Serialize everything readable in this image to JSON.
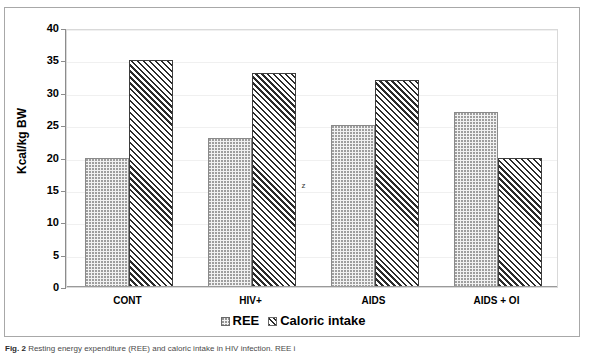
{
  "figure": {
    "caption_label": "Fig. 2",
    "caption_text": "Resting energy expenditure (REE) and caloric intake in HIV infection. REE i"
  },
  "chart_data": {
    "type": "bar",
    "title": "",
    "xlabel": "",
    "ylabel": "Kcal/kg BW",
    "categories": [
      "CONT",
      "HIV+",
      "AIDS",
      "AIDS + OI"
    ],
    "series": [
      {
        "name": "REE",
        "values": [
          20,
          23,
          25,
          27
        ],
        "pattern": "dotted"
      },
      {
        "name": "Caloric intake",
        "values": [
          35,
          33,
          32,
          20
        ],
        "pattern": "diagonal-hatch"
      }
    ],
    "ylim": [
      0,
      40
    ],
    "ytick_step": 5,
    "yticks": [
      0,
      5,
      10,
      15,
      20,
      25,
      30,
      35,
      40
    ],
    "grid": true,
    "legend_position": "bottom-center",
    "annotations": [
      {
        "text": "z",
        "category": "HIV+",
        "value": 16.5
      }
    ]
  },
  "legend": {
    "entries": [
      {
        "label": "REE"
      },
      {
        "label": "Caloric intake"
      }
    ]
  },
  "colors": {
    "frame": "#a8a8a8",
    "plot_border": "#d9d9d9",
    "gridline": "#f0f0f0",
    "axis": "#8c8c8c",
    "ree_fill": "#f2f2f2",
    "caloric_fill": "#2b2b2b",
    "text": "#000000"
  }
}
